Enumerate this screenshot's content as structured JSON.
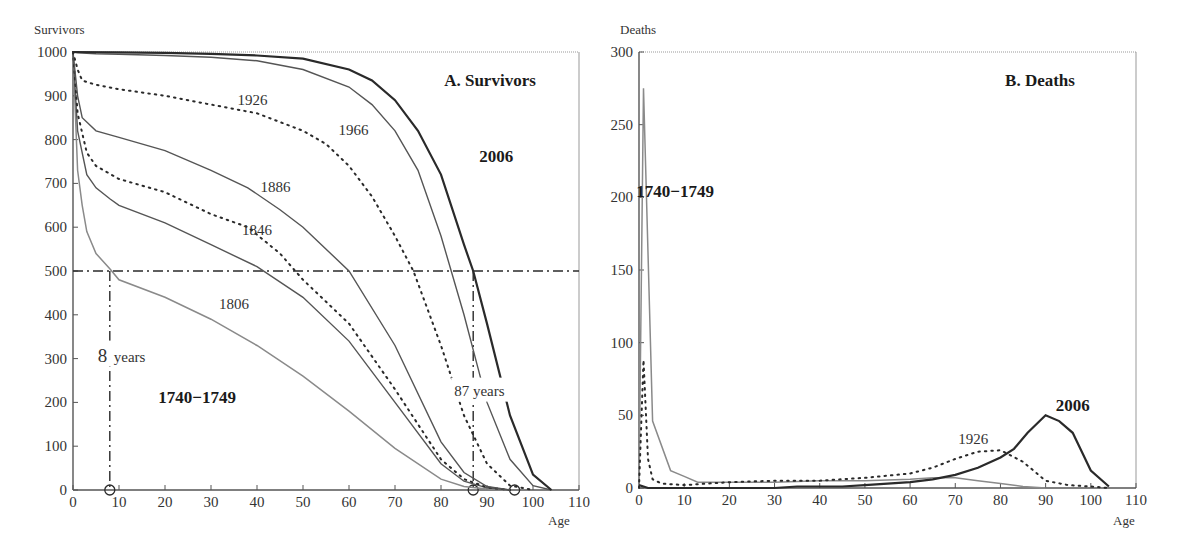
{
  "chart_data": [
    {
      "type": "line",
      "title": "A. Survivors",
      "xlabel": "Age",
      "ylabel": "Survivors",
      "xlim": [
        0,
        110
      ],
      "ylim": [
        0,
        1000
      ],
      "x_ticks": [
        0,
        10,
        20,
        30,
        40,
        50,
        60,
        70,
        80,
        90,
        100,
        110
      ],
      "y_ticks": [
        0,
        100,
        200,
        300,
        400,
        500,
        600,
        700,
        800,
        900,
        1000
      ],
      "grid": false,
      "reference_line": {
        "y": 500,
        "style": "dash-dot"
      },
      "annotations": [
        {
          "text": "8",
          "suffix": "years",
          "x": 8,
          "y": 300,
          "note": "median age at death 1740-1749"
        },
        {
          "text": "87 years",
          "x": 87,
          "y": 220,
          "note": "median age at death 2006"
        }
      ],
      "markers": [
        {
          "x": 8,
          "y": 0
        },
        {
          "x": 87,
          "y": 0
        },
        {
          "x": 96,
          "y": 0
        }
      ],
      "series": [
        {
          "name": "1740-1749",
          "style": "solid-gray",
          "bold_label": true,
          "x": [
            0,
            1,
            2,
            3,
            5,
            8,
            10,
            20,
            30,
            40,
            50,
            60,
            70,
            80,
            85,
            90,
            95
          ],
          "y": [
            1000,
            730,
            650,
            590,
            540,
            505,
            480,
            440,
            390,
            330,
            260,
            180,
            95,
            25,
            8,
            2,
            0
          ]
        },
        {
          "name": "1806",
          "style": "solid",
          "x": [
            0,
            1,
            3,
            5,
            8,
            10,
            20,
            30,
            40,
            50,
            60,
            70,
            80,
            85,
            90,
            95
          ],
          "y": [
            1000,
            820,
            720,
            690,
            665,
            650,
            610,
            560,
            510,
            440,
            340,
            200,
            60,
            20,
            5,
            0
          ]
        },
        {
          "name": "1846",
          "style": "dotted",
          "x": [
            0,
            1,
            3,
            5,
            10,
            20,
            30,
            38,
            45,
            50,
            60,
            70,
            80,
            85,
            90,
            95
          ],
          "y": [
            1000,
            860,
            770,
            740,
            710,
            680,
            630,
            600,
            540,
            480,
            380,
            230,
            70,
            25,
            6,
            0
          ]
        },
        {
          "name": "1886",
          "style": "solid",
          "x": [
            0,
            1,
            2,
            5,
            10,
            20,
            30,
            38,
            45,
            50,
            60,
            70,
            80,
            85,
            90,
            95
          ],
          "y": [
            1000,
            900,
            850,
            820,
            805,
            775,
            730,
            690,
            640,
            600,
            500,
            330,
            110,
            40,
            8,
            0
          ]
        },
        {
          "name": "1926",
          "style": "dotted",
          "x": [
            0,
            1,
            2,
            5,
            10,
            20,
            30,
            40,
            50,
            55,
            60,
            65,
            70,
            74,
            80,
            85,
            90,
            95,
            100
          ],
          "y": [
            1000,
            960,
            935,
            925,
            915,
            900,
            880,
            860,
            820,
            790,
            740,
            670,
            580,
            500,
            330,
            170,
            60,
            10,
            0
          ]
        },
        {
          "name": "1966",
          "style": "solid",
          "x": [
            0,
            1,
            5,
            10,
            20,
            30,
            40,
            50,
            60,
            65,
            70,
            75,
            80,
            85,
            88,
            90,
            95,
            100,
            104
          ],
          "y": [
            1000,
            998,
            996,
            995,
            992,
            988,
            980,
            960,
            920,
            880,
            820,
            730,
            580,
            400,
            280,
            200,
            70,
            10,
            0
          ]
        },
        {
          "name": "2006",
          "style": "solid-bold",
          "bold_label": true,
          "x": [
            0,
            10,
            20,
            30,
            40,
            50,
            60,
            65,
            70,
            75,
            80,
            85,
            87,
            90,
            95,
            100,
            104
          ],
          "y": [
            1000,
            999,
            998,
            996,
            992,
            985,
            960,
            935,
            890,
            820,
            720,
            560,
            500,
            380,
            170,
            35,
            0
          ]
        }
      ],
      "curve_labels": [
        {
          "text": "1926",
          "x": 39,
          "y": 880
        },
        {
          "text": "1966",
          "x": 61,
          "y": 810
        },
        {
          "text": "2006",
          "x": 92,
          "y": 750,
          "bold": true
        },
        {
          "text": "1886",
          "x": 44,
          "y": 680
        },
        {
          "text": "1846",
          "x": 40,
          "y": 583
        },
        {
          "text": "1806",
          "x": 35,
          "y": 413
        },
        {
          "text": "1740−1749",
          "x": 27,
          "y": 198,
          "bold": true
        }
      ]
    },
    {
      "type": "line",
      "title": "B. Deaths",
      "xlabel": "Age",
      "ylabel": "Deaths",
      "xlim": [
        0,
        110
      ],
      "ylim": [
        0,
        300
      ],
      "x_ticks": [
        0,
        10,
        20,
        30,
        40,
        50,
        60,
        70,
        80,
        90,
        100,
        110
      ],
      "y_ticks": [
        0,
        50,
        100,
        150,
        200,
        250,
        300
      ],
      "grid": false,
      "series": [
        {
          "name": "1740-1749",
          "style": "solid-gray",
          "bold_label": true,
          "x": [
            0,
            1,
            3,
            7,
            10,
            13,
            20,
            30,
            40,
            50,
            60,
            65,
            70,
            75,
            80,
            85,
            90
          ],
          "y": [
            0,
            275,
            46,
            12,
            8,
            4,
            4,
            4,
            5,
            5,
            6,
            7,
            7,
            5,
            3,
            1,
            0
          ]
        },
        {
          "name": "1926",
          "style": "dotted",
          "x": [
            0,
            1,
            2,
            3,
            5,
            10,
            15,
            20,
            30,
            40,
            50,
            60,
            65,
            70,
            75,
            80,
            85,
            90,
            95,
            100,
            104
          ],
          "y": [
            0,
            88,
            20,
            6,
            3,
            2,
            3,
            4,
            5,
            5,
            7,
            10,
            14,
            20,
            25,
            26,
            18,
            5,
            2,
            1,
            0
          ]
        },
        {
          "name": "2006",
          "style": "solid-bold",
          "bold_label": true,
          "x": [
            0,
            1,
            2,
            10,
            20,
            30,
            35,
            40,
            45,
            50,
            55,
            60,
            65,
            70,
            75,
            80,
            83,
            86,
            90,
            93,
            96,
            100,
            104
          ],
          "y": [
            2,
            1,
            0,
            0,
            0,
            0,
            1,
            1,
            1,
            2,
            3,
            4,
            6,
            9,
            14,
            21,
            27,
            38,
            50,
            46,
            38,
            12,
            1
          ]
        }
      ],
      "curve_labels": [
        {
          "text": "1740−1749",
          "x": 8,
          "y": 200,
          "bold": true
        },
        {
          "text": "1926",
          "x": 74,
          "y": 30
        },
        {
          "text": "2006",
          "x": 96,
          "y": 53,
          "bold": true
        }
      ]
    }
  ],
  "panels": {
    "a": {
      "title": "A. Survivors",
      "ylabel": "Survivors",
      "xlabel": "Age"
    },
    "b": {
      "title": "B. Deaths",
      "ylabel": "Deaths",
      "xlabel": "Age"
    }
  },
  "colors": {
    "axis": "#555555",
    "dark_line": "#2a2a2a",
    "mid_line": "#555555",
    "gray_line": "#8a8a8a",
    "frame": "#999999"
  }
}
